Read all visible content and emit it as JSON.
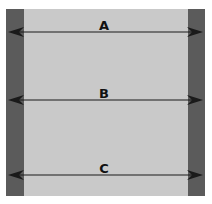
{
  "diagram": {
    "colors": {
      "background": "#ffffff",
      "panel": "#c9c9c9",
      "bars": "#5b5b5b",
      "arrow": "#1a1a1a"
    },
    "arrows": [
      {
        "label": "A",
        "y": 32
      },
      {
        "label": "B",
        "y": 100
      },
      {
        "label": "C",
        "y": 175
      }
    ]
  }
}
